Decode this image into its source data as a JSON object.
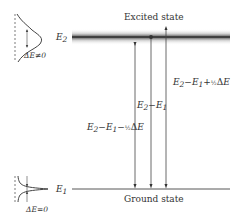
{
  "diagram": {
    "type": "energy-level-diagram",
    "levels": {
      "upper": {
        "symbol": "E",
        "subscript": "2",
        "state_label": "Excited state",
        "broadened": true
      },
      "lower": {
        "symbol": "E",
        "subscript": "1",
        "state_label": "Ground state",
        "broadened": false
      }
    },
    "transitions": [
      {
        "label": "E₂−E₁−½ΔE",
        "direction": "down"
      },
      {
        "label": "E₂−E₁",
        "direction": "down"
      },
      {
        "label": "E₂−E₁+½ΔE",
        "direction": "down"
      }
    ],
    "insets": {
      "upper_profile_label": "ΔE≠0",
      "lower_profile_label": "ΔE=0"
    }
  }
}
